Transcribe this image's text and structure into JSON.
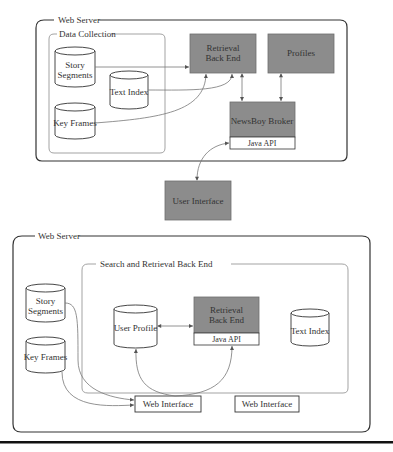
{
  "colors": {
    "box_fill": "#8c8c8c",
    "box_stroke": "#6e6e6e",
    "outer_stroke": "#333333",
    "inner_stroke": "#999999",
    "line": "#777777",
    "rule": "#111111"
  },
  "top_diagram": {
    "web_server_label": "Web Server",
    "data_collection_label": "Data Collection",
    "story_segments_line1": "Story",
    "story_segments_line2": "Segments",
    "text_index": "Text Index",
    "key_frames": "Key Frames",
    "retrieval_line1": "Retrieval",
    "retrieval_line2": "Back End",
    "profiles": "Profiles",
    "newsboy_broker": "NewsBoy Broker",
    "java_api": "Java API",
    "user_interface": "User Interface"
  },
  "bottom_diagram": {
    "web_server_label": "Web Server",
    "search_retrieval_label": "Search and Retrieval Back End",
    "story_segments_line1": "Story",
    "story_segments_line2": "Segments",
    "key_frames": "Key Frames",
    "user_profile": "User Profile",
    "retrieval_line1": "Retrieval",
    "retrieval_line2": "Back End",
    "java_api": "Java API",
    "text_index": "Text Index",
    "web_interface_1": "Web Interface",
    "web_interface_2": "Web Interface"
  }
}
